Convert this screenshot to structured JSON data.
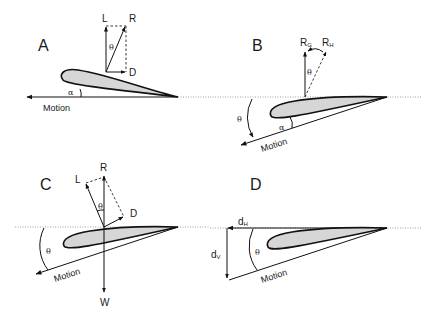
{
  "figure": {
    "panels": [
      {
        "id": "A",
        "label": "A",
        "vectors": {
          "lift": "L",
          "resultant": "R",
          "drag": "D"
        },
        "angles": {
          "theta": "θ",
          "alpha": "α"
        },
        "motion_label": "Motion"
      },
      {
        "id": "B",
        "label": "B",
        "vectors": {
          "r_g_main": "R",
          "r_g_sub": "G",
          "r_h_main": "R",
          "r_h_sub": "H"
        },
        "angles": {
          "theta_vec": "θ",
          "theta_glide": "θ",
          "alpha": "α"
        },
        "motion_label": "Motion"
      },
      {
        "id": "C",
        "label": "C",
        "vectors": {
          "lift": "L",
          "resultant": "R",
          "drag": "D",
          "weight": "W"
        },
        "angles": {
          "theta_vec": "θ",
          "theta_glide": "θ"
        },
        "motion_label": "Motion"
      },
      {
        "id": "D",
        "label": "D",
        "distances": {
          "dh_main": "d",
          "dh_sub": "H",
          "dv_main": "d",
          "dv_sub": "V"
        },
        "angles": {
          "theta": "θ"
        },
        "motion_label": "Motion"
      }
    ]
  }
}
